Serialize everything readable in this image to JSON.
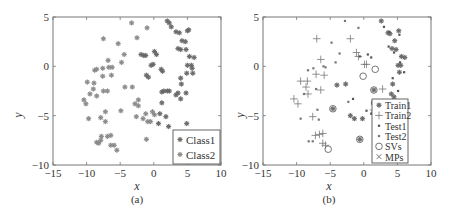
{
  "chart_data": [
    {
      "type": "scatter",
      "caption": "(a)",
      "xlabel": "x",
      "ylabel": "y",
      "xlim": [
        -15,
        10
      ],
      "ylim": [
        -10,
        5
      ],
      "xticks": [
        -15,
        -10,
        -5,
        0,
        5,
        10
      ],
      "yticks": [
        -10,
        -5,
        0,
        5
      ],
      "grid": false,
      "legend_position": "lower right",
      "legend": [
        "Class1",
        "Class2"
      ],
      "series": [
        {
          "name": "Class1",
          "marker": "asterisk",
          "color": "#666666",
          "points": [
            [
              2,
              4.6
            ],
            [
              2.3,
              4.4
            ],
            [
              2.6,
              4
            ],
            [
              3.3,
              3.5
            ],
            [
              3.8,
              3.4
            ],
            [
              5.0,
              3.6
            ],
            [
              5.2,
              3.7
            ],
            [
              4.2,
              2.6
            ],
            [
              4.7,
              2.5
            ],
            [
              3.6,
              1.8
            ],
            [
              4.0,
              1.7
            ],
            [
              4.8,
              1.7
            ],
            [
              5.3,
              1.0
            ],
            [
              6.0,
              0.9
            ],
            [
              5.0,
              0.1
            ],
            [
              5.6,
              0.1
            ],
            [
              5.7,
              -0.2
            ],
            [
              5.8,
              -0.7
            ],
            [
              4.9,
              -0.7
            ],
            [
              4.0,
              -1.2
            ],
            [
              4.1,
              -1.8
            ],
            [
              3.6,
              -2.7
            ],
            [
              4.8,
              -2.7
            ],
            [
              3.3,
              -2.9
            ],
            [
              4.0,
              -3.3
            ],
            [
              1.2,
              -2.6
            ],
            [
              1.5,
              -2.5
            ],
            [
              2.0,
              -2.5
            ],
            [
              2.3,
              -2.5
            ],
            [
              0.1,
              1.5
            ],
            [
              0.4,
              1.2
            ],
            [
              -0.1,
              0.2
            ],
            [
              -0.4,
              0.1
            ],
            [
              1.1,
              -0.3
            ],
            [
              1.3,
              -0.5
            ],
            [
              -1.1,
              -0.9
            ],
            [
              -0.8,
              -1.1
            ],
            [
              -1.5,
              1.1
            ],
            [
              -1.9,
              1.2
            ],
            [
              -1.2,
              1.1
            ],
            [
              1.2,
              -3.7
            ],
            [
              0.9,
              -4.8
            ],
            [
              1.8,
              -5.1
            ],
            [
              2.2,
              -6.1
            ],
            [
              0.7,
              -5.8
            ],
            [
              4.9,
              -5.8
            ]
          ]
        },
        {
          "name": "Class2",
          "marker": "asterisk",
          "color": "#888888",
          "points": [
            [
              -3.3,
              4.4
            ],
            [
              -7.5,
              2.8
            ],
            [
              -5.3,
              2.3
            ],
            [
              -2.5,
              2.9
            ],
            [
              -1.0,
              3.9
            ],
            [
              -4.4,
              1.2
            ],
            [
              -4.8,
              0.4
            ],
            [
              -6.8,
              0.6
            ],
            [
              -6.7,
              -0.1
            ],
            [
              -6.2,
              -0.1
            ],
            [
              -7.6,
              -0.2
            ],
            [
              -8.8,
              -0.4
            ],
            [
              -8.5,
              -0.3
            ],
            [
              -7.6,
              -1.0
            ],
            [
              -6.3,
              -0.9
            ],
            [
              -9.9,
              -1.6
            ],
            [
              -8.9,
              -1.7
            ],
            [
              -9.0,
              -2.3
            ],
            [
              -7.5,
              -2.5
            ],
            [
              -6.9,
              -2.5
            ],
            [
              -4.3,
              -2.1
            ],
            [
              -3.2,
              -2.1
            ],
            [
              -9.5,
              -2.8
            ],
            [
              -8.5,
              -3.0
            ],
            [
              -10.4,
              -3.4
            ],
            [
              -10.1,
              -3.8
            ],
            [
              -2.3,
              -3.4
            ],
            [
              -2.8,
              -3.8
            ],
            [
              -2.3,
              -4.0
            ],
            [
              -4.9,
              -4.5
            ],
            [
              -7.2,
              -4.6
            ],
            [
              -9.7,
              -5.3
            ],
            [
              -7.9,
              -5.2
            ],
            [
              -7.2,
              -5.6
            ],
            [
              -1.2,
              -4.8
            ],
            [
              -0.2,
              -4.6
            ],
            [
              0.1,
              -4.9
            ],
            [
              -2.6,
              -5.1
            ],
            [
              -1.6,
              -5.3
            ],
            [
              -0.9,
              -5.6
            ],
            [
              -0.5,
              -5.6
            ],
            [
              -7.8,
              -7.1
            ],
            [
              -6.9,
              -7.1
            ],
            [
              -6.4,
              -7.0
            ],
            [
              -7.9,
              -7.5
            ],
            [
              -8.5,
              -7.7
            ],
            [
              -8.2,
              -7.8
            ],
            [
              -6.4,
              -8.0
            ],
            [
              -5.9,
              -8.0
            ],
            [
              -5.5,
              -8.5
            ],
            [
              -1.1,
              -7.4
            ]
          ]
        }
      ]
    },
    {
      "type": "scatter",
      "caption": "(b)",
      "xlabel": "x",
      "ylabel": "y",
      "xlim": [
        -15,
        10
      ],
      "ylim": [
        -10,
        5
      ],
      "xticks": [
        -15,
        -10,
        -5,
        0,
        5,
        10
      ],
      "yticks": [
        -10,
        -5,
        0,
        5
      ],
      "grid": false,
      "legend_position": "lower right",
      "legend": [
        "Train1",
        "Train2",
        "Test1",
        "Test2",
        "SVs",
        "MPs"
      ],
      "series": [
        {
          "name": "Train1",
          "marker": "asterisk",
          "color": "#666666",
          "points": [
            [
              2.6,
              4.6
            ],
            [
              3.6,
              3.4
            ],
            [
              3.9,
              3.3
            ],
            [
              5.2,
              3.6
            ],
            [
              4.6,
              2.6
            ],
            [
              4.2,
              1.8
            ],
            [
              4.8,
              1.7
            ],
            [
              5.6,
              1.0
            ],
            [
              6.1,
              0.9
            ],
            [
              5.1,
              0.1
            ],
            [
              5.5,
              0.1
            ],
            [
              5.3,
              -0.6
            ],
            [
              4.3,
              -1.8
            ],
            [
              4.1,
              -2.8
            ],
            [
              4.5,
              -3.1
            ],
            [
              -4.0,
              -1.9
            ],
            [
              -2.7,
              -1.8
            ],
            [
              1.5,
              -2.4
            ],
            [
              -4.6,
              -4.3
            ],
            [
              -2.0,
              -5.0
            ],
            [
              -1.4,
              -5.3
            ],
            [
              -0.2,
              -5.3
            ],
            [
              2.4,
              -5.0
            ],
            [
              -0.6,
              -7.4
            ]
          ]
        },
        {
          "name": "Train2",
          "marker": "plus",
          "color": "#777777",
          "points": [
            [
              -7.0,
              2.8
            ],
            [
              -2.0,
              2.8
            ],
            [
              -1.1,
              1.4
            ],
            [
              -0.8,
              1.0
            ],
            [
              0.1,
              0.2
            ],
            [
              0.4,
              0.2
            ],
            [
              -6.4,
              0.7
            ],
            [
              -7.1,
              -0.8
            ],
            [
              -5.9,
              -0.9
            ],
            [
              -9.4,
              -1.5
            ],
            [
              -8.4,
              -1.5
            ],
            [
              -8.6,
              -2.1
            ],
            [
              -6.4,
              -2.4
            ],
            [
              -8.3,
              -2.8
            ],
            [
              -10.4,
              -3.3
            ],
            [
              -9.8,
              -3.8
            ],
            [
              -7.6,
              -5.1
            ],
            [
              -7.2,
              -7.0
            ],
            [
              -6.6,
              -6.9
            ],
            [
              -6.1,
              -6.8
            ],
            [
              -6.1,
              -7.8
            ],
            [
              -5.7,
              -8.0
            ],
            [
              2.8,
              -2.3
            ]
          ]
        },
        {
          "name": "Test1",
          "marker": "dot",
          "color": "#555555",
          "points": [
            [
              3.0,
              4.0
            ],
            [
              3.8,
              3.5
            ],
            [
              5.3,
              3.2
            ],
            [
              3.7,
              2.0
            ],
            [
              4.5,
              1.4
            ],
            [
              5.4,
              0.4
            ],
            [
              6.0,
              -0.6
            ],
            [
              4.3,
              -1.2
            ],
            [
              5.1,
              -2.5
            ],
            [
              0.6,
              1.2
            ],
            [
              1.1,
              0.9
            ],
            [
              -0.6,
              1.0
            ],
            [
              -1.6,
              -3.3
            ],
            [
              0.4,
              -4.5
            ],
            [
              1.1,
              -4.8
            ]
          ]
        },
        {
          "name": "Test2",
          "marker": "dot",
          "color": "#777777",
          "points": [
            [
              -2.8,
              4.6
            ],
            [
              -0.8,
              3.9
            ],
            [
              -4.8,
              2.4
            ],
            [
              -3.6,
              1.3
            ],
            [
              -4.2,
              0.4
            ],
            [
              -6.0,
              0.0
            ],
            [
              -7.5,
              -0.2
            ],
            [
              -8.3,
              -0.4
            ],
            [
              -5.7,
              -0.1
            ],
            [
              -8.9,
              -2.8
            ],
            [
              -7.1,
              -2.3
            ],
            [
              -6.9,
              -4.4
            ],
            [
              -6.7,
              -5.4
            ],
            [
              -9.4,
              -5.3
            ],
            [
              -8.2,
              -7.6
            ],
            [
              -7.6,
              -7.6
            ],
            [
              -2.3,
              -3.6
            ]
          ]
        },
        {
          "name": "SVs",
          "marker": "circle",
          "color": "#666666",
          "points": [
            [
              1.7,
              -0.3
            ],
            [
              -0.1,
              -1.0
            ],
            [
              1.5,
              -2.4
            ],
            [
              -4.6,
              -4.3
            ],
            [
              1.6,
              -3.7
            ],
            [
              -5.3,
              -8.4
            ],
            [
              -0.6,
              -7.4
            ]
          ]
        },
        {
          "name": "MPs",
          "marker": "x",
          "color": "#666666",
          "points": [
            [
              1.3,
              -4.6
            ]
          ]
        }
      ]
    }
  ],
  "panels": {
    "a": {
      "caption": "(a)",
      "xlabel": "x",
      "ylabel": "y",
      "legend": [
        "Class1",
        "Class2"
      ]
    },
    "b": {
      "caption": "(b)",
      "xlabel": "x",
      "ylabel": "y",
      "legend": [
        "Train1",
        "Train2",
        "Test1",
        "Test2",
        "SVs",
        "MPs"
      ]
    }
  },
  "ticks": {
    "x": [
      "-15",
      "-10",
      "-5",
      "0",
      "5",
      "10"
    ],
    "y": [
      "-10",
      "-5",
      "0",
      "5"
    ]
  }
}
